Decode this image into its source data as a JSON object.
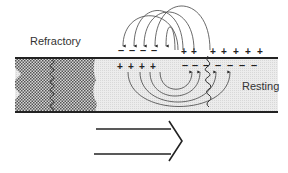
{
  "diagram": {
    "labels": {
      "refractory": "Refractory",
      "resting": "Resting"
    },
    "charges": {
      "top_left_minus": "– – – –",
      "top_right_plus": "+ +   + + + + +",
      "bottom_left_plus": "+ + + +",
      "bottom_right_minus": "– – – – – – –"
    },
    "regions": [
      "refractory-zone",
      "active-depolarized-zone",
      "resting-zone"
    ],
    "direction": "left-to-right",
    "colors": {
      "line": "#222222",
      "axon_fill": "#e8e8e8",
      "refractory_fill": "#9a9a9a",
      "text": "#333333"
    }
  }
}
